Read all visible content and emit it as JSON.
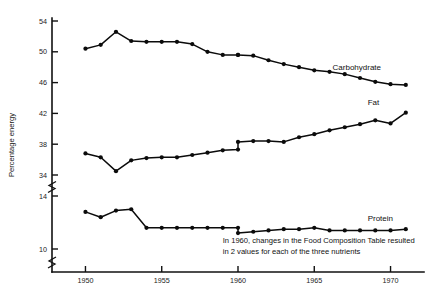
{
  "chart_data": {
    "type": "line",
    "title": "",
    "subtitle": "",
    "xlabel": "",
    "ylabel": "Percentage energy",
    "grid": false,
    "legend_position": "inline-right",
    "xlim": [
      1948.2,
      1971.8
    ],
    "x_ticks": [
      1950,
      1955,
      1960,
      1965,
      1970
    ],
    "x_tick_labels": [
      "1950",
      "1955",
      "1960",
      "1965",
      "1970"
    ],
    "y_ticks": [
      10,
      14,
      34,
      38,
      42,
      46,
      50,
      54
    ],
    "y_tick_labels": [
      "10",
      "14",
      "34",
      "38",
      "42",
      "46",
      "50",
      "54"
    ],
    "axis_breaks": [
      {
        "between": [
          14,
          34
        ],
        "note": "axis break between 14 and 34"
      },
      {
        "below": 10,
        "note": "axis break below 10"
      }
    ],
    "annotations": [
      {
        "text_line_1": "In 1960, changes in the Food Composition Table resulted",
        "text_line_2": "in 2 values for each of the three nutrients",
        "x": 1959.0,
        "y_px": 243
      }
    ],
    "series": [
      {
        "name": "Carbohydrate",
        "label": "Carbohydrate",
        "label_x": 1966.2,
        "label_y": 47.6,
        "x": [
          1950,
          1951,
          1952,
          1953,
          1954,
          1955,
          1956,
          1957,
          1958,
          1959,
          1960,
          1960,
          1961,
          1962,
          1963,
          1964,
          1965,
          1966,
          1967,
          1968,
          1969,
          1970,
          1971
        ],
        "values": [
          50.4,
          50.9,
          52.6,
          51.4,
          51.3,
          51.3,
          51.3,
          51.0,
          50.0,
          49.6,
          49.6,
          49.6,
          49.5,
          48.9,
          48.4,
          48.0,
          47.6,
          47.4,
          47.1,
          46.6,
          46.1,
          45.8,
          45.7
        ]
      },
      {
        "name": "Fat",
        "label": "Fat",
        "label_x": 1968.5,
        "label_y": 43.1,
        "x": [
          1950,
          1951,
          1952,
          1953,
          1954,
          1955,
          1956,
          1957,
          1958,
          1959,
          1960,
          1960,
          1961,
          1962,
          1963,
          1964,
          1965,
          1966,
          1967,
          1968,
          1969,
          1970,
          1971
        ],
        "values": [
          36.8,
          36.3,
          34.5,
          35.9,
          36.2,
          36.3,
          36.3,
          36.6,
          36.9,
          37.2,
          37.3,
          38.3,
          38.4,
          38.4,
          38.3,
          38.9,
          39.3,
          39.8,
          40.2,
          40.6,
          41.1,
          40.7,
          42.1
        ]
      },
      {
        "name": "Protein",
        "label": "Protein",
        "label_x": 1968.5,
        "label_y": 12.1,
        "x": [
          1950,
          1951,
          1952,
          1953,
          1954,
          1955,
          1956,
          1957,
          1958,
          1959,
          1960,
          1960,
          1961,
          1962,
          1963,
          1964,
          1965,
          1966,
          1967,
          1968,
          1969,
          1970,
          1971
        ],
        "values": [
          12.8,
          12.4,
          12.9,
          13.0,
          11.6,
          11.6,
          11.6,
          11.6,
          11.6,
          11.6,
          11.6,
          11.2,
          11.3,
          11.4,
          11.5,
          11.5,
          11.6,
          11.4,
          11.4,
          11.4,
          11.4,
          11.4,
          11.5
        ]
      }
    ]
  },
  "axis": {
    "y_label": "Percentage energy"
  },
  "colors": {
    "line": "#0b0b0b",
    "axis": "#111111",
    "background": "#ffffff"
  }
}
